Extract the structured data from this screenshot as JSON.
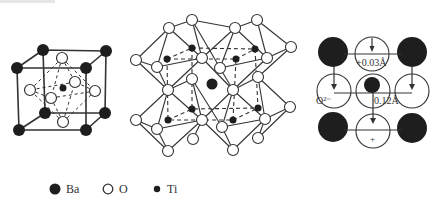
{
  "figure": {
    "panels": [
      {
        "id": "unit-cell",
        "description": "BaTiO3 perovskite unit cell (Ba corners, O face centers, Ti body center)"
      },
      {
        "id": "octahedra-network",
        "description": "Corner-sharing TiO6 octahedra with Ba in cavity"
      },
      {
        "id": "displacement-projection",
        "description": "Projected ion displacements in tetragonal BaTiO3",
        "annotations": {
          "top_shift": "+0.03Å",
          "oxygen_label": "O²⁻",
          "ti_shift": "0.12Å",
          "bottom_sign": "+"
        }
      }
    ],
    "legend": [
      {
        "symbol": "large-filled-circle",
        "label": "Ba"
      },
      {
        "symbol": "open-circle",
        "label": "O"
      },
      {
        "symbol": "small-filled-circle",
        "label": "Ti"
      }
    ],
    "colors": {
      "atom_dark": "#1e1e1e",
      "line": "#333333",
      "open_fill": "#ffffff"
    }
  }
}
